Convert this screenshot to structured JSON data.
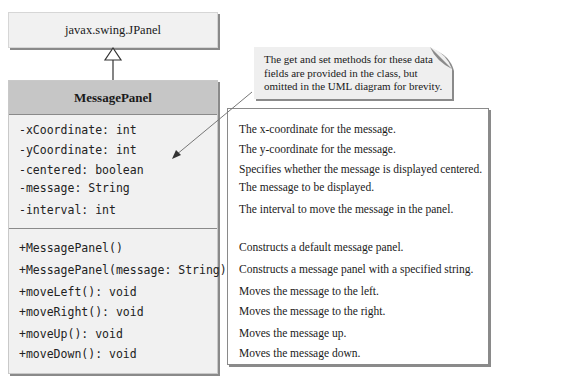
{
  "superclass": {
    "name": "javax.swing.JPanel"
  },
  "class": {
    "name": "MessagePanel",
    "fields": [
      {
        "signature": "-xCoordinate: int",
        "description": "The x-coordinate for the message."
      },
      {
        "signature": "-yCoordinate: int",
        "description": "The y-coordinate for the message."
      },
      {
        "signature": "-centered: boolean",
        "description": "Specifies whether the message is displayed centered."
      },
      {
        "signature": "-message: String",
        "description": "The message to be displayed."
      },
      {
        "signature": "-interval: int",
        "description": "The interval to move the message in the panel."
      }
    ],
    "methods": [
      {
        "signature": "+MessagePanel()",
        "description": "Constructs a default message panel."
      },
      {
        "signature": "+MessagePanel(message: String)",
        "description": "Constructs a message panel with a specified string."
      },
      {
        "signature": "+moveLeft(): void",
        "description": "Moves the message to the left."
      },
      {
        "signature": "+moveRight(): void",
        "description": "Moves the message to the right."
      },
      {
        "signature": "+moveUp(): void",
        "description": "Moves the message up."
      },
      {
        "signature": "+moveDown(): void",
        "description": "Moves the message down."
      }
    ]
  },
  "note": {
    "lines": [
      "The get and set methods for these data",
      "fields are provided in the class, but",
      "omitted in the UML diagram for brevity."
    ]
  },
  "colors": {
    "box_fill": "#f1f1f1",
    "header_fill": "#c6c6c6",
    "shadow": "#8a8a8a"
  }
}
